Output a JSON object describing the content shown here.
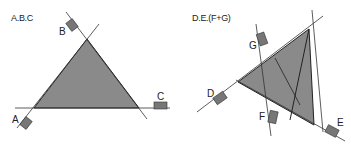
{
  "diagrams": [
    {
      "title": "A.B.C",
      "labels": {
        "a": "A",
        "b": "B",
        "c": "C"
      }
    },
    {
      "title": "D.E.(F+G)",
      "labels": {
        "d": "D",
        "e": "E",
        "f": "F",
        "g": "G"
      }
    }
  ],
  "colors": {
    "fill": "#8a8a8a",
    "line": "#222222",
    "marker": "#777777"
  }
}
